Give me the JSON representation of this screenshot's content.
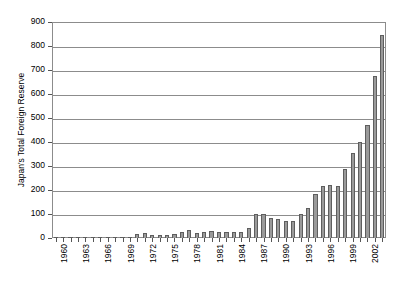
{
  "chart_data": {
    "type": "bar",
    "title": "",
    "xlabel": "",
    "ylabel": "Japan's Total Foreign Reserve",
    "ylim": [
      0,
      900
    ],
    "ytick_labels": [
      "0",
      "100",
      "200",
      "300",
      "400",
      "500",
      "600",
      "700",
      "800",
      "900"
    ],
    "yticks": [
      0,
      100,
      200,
      300,
      400,
      500,
      600,
      700,
      800,
      900
    ],
    "grid": true,
    "legend": "none",
    "xtick_labels_shown": [
      "1960",
      "1963",
      "1966",
      "1969",
      "1972",
      "1975",
      "1978",
      "1981",
      "1984",
      "1987",
      "1990",
      "1993",
      "1996",
      "1999",
      "2002"
    ],
    "xtick_label_interval": 3,
    "bar_color": "#9a9a9a",
    "bar_edge_color": "#5e5e5e",
    "axis_color": "#8c8c8c",
    "categories": [
      "1960",
      "1961",
      "1962",
      "1963",
      "1964",
      "1965",
      "1966",
      "1967",
      "1968",
      "1969",
      "1970",
      "1971",
      "1972",
      "1973",
      "1974",
      "1975",
      "1976",
      "1977",
      "1978",
      "1979",
      "1980",
      "1981",
      "1982",
      "1983",
      "1984",
      "1985",
      "1986",
      "1987",
      "1988",
      "1989",
      "1990",
      "1991",
      "1992",
      "1993",
      "1994",
      "1995",
      "1996",
      "1997",
      "1998",
      "1999",
      "2000",
      "2001",
      "2002",
      "2003",
      "2004"
    ],
    "values": [
      2,
      2,
      2,
      2,
      2,
      2,
      2,
      2,
      3,
      4,
      5,
      15,
      19,
      12,
      14,
      13,
      17,
      23,
      33,
      20,
      25,
      28,
      24,
      25,
      27,
      27,
      42,
      98,
      98,
      85,
      79,
      72,
      72,
      99,
      126,
      184,
      217,
      220,
      215,
      288,
      356,
      402,
      469,
      674,
      845
    ]
  }
}
